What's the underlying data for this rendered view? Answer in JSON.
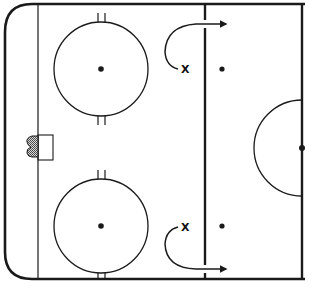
{
  "diagram": {
    "type": "hockey-half-rink-drill",
    "colors": {
      "line": "#1a1a1a",
      "background": "#ffffff",
      "net_fill": "#9a9a9a"
    },
    "players": [
      {
        "label": "X",
        "position": "top-slot"
      },
      {
        "label": "X",
        "position": "bottom-slot"
      }
    ],
    "elements": [
      "boards",
      "goal-line",
      "blue-line",
      "center-red-line",
      "top-faceoff-circle",
      "bottom-faceoff-circle",
      "goal-net",
      "goal-crease",
      "neutral-zone-dot-top",
      "neutral-zone-dot-bottom",
      "center-circle-half",
      "center-dot",
      "skating-path-arrow-top",
      "skating-path-arrow-bottom"
    ]
  }
}
